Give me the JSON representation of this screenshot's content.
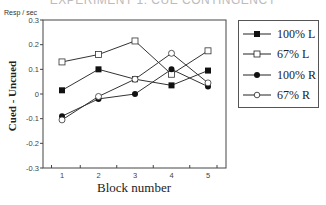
{
  "title": "EXPERIMENT 1: CUE CONTINGENCY",
  "chart_data": {
    "type": "line",
    "title": "EXPERIMENT 1: CUE CONTINGENCY",
    "xlabel": "Block number",
    "ylabel": "Cued - Uncued",
    "yunit": "Resp / sec",
    "x": [
      1,
      2,
      3,
      4,
      5
    ],
    "categories": [
      "1",
      "2",
      "3",
      "4",
      "5"
    ],
    "yticks": [
      "0.3",
      "0.2",
      "0.1",
      "0",
      "-0.1",
      "-0.2",
      "-0.3"
    ],
    "ylim": [
      -0.3,
      0.3
    ],
    "grid": false,
    "legend_position": "right",
    "series": [
      {
        "name": "100% L",
        "marker": "filled-square",
        "values": [
          0.015,
          0.1,
          0.06,
          0.035,
          0.095
        ]
      },
      {
        "name": "67% L",
        "marker": "open-square",
        "values": [
          0.13,
          0.16,
          0.215,
          0.08,
          0.175
        ]
      },
      {
        "name": "100% R",
        "marker": "filled-circle",
        "values": [
          -0.09,
          -0.02,
          0.0,
          0.1,
          0.03
        ]
      },
      {
        "name": "67% R",
        "marker": "open-circle",
        "values": [
          -0.105,
          -0.01,
          0.06,
          0.165,
          0.045
        ]
      }
    ]
  },
  "labels": {
    "unit": "Resp / sec",
    "ylabel": "Cued - Uncued",
    "xlabel": "Block number"
  },
  "legend": [
    "100% L",
    "67% L",
    "100% R",
    "67% R"
  ]
}
